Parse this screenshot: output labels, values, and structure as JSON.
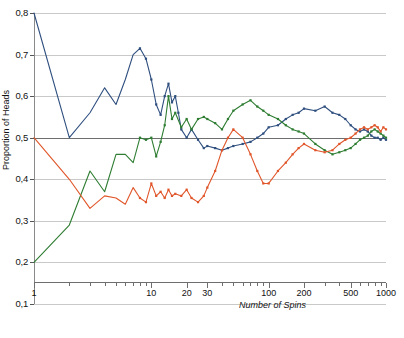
{
  "chart_data": {
    "type": "line",
    "title": "",
    "xlabel": "Number of Spins",
    "ylabel": "Proportion of Heads",
    "xscale": "log",
    "xlim": [
      1,
      1000
    ],
    "ylim": [
      0.1,
      0.8
    ],
    "grid": true,
    "legend": "none",
    "reference_line": {
      "y": 0.5,
      "label": "0,5"
    },
    "y_ticks": [
      0.8,
      0.7,
      0.6,
      0.5,
      0.4,
      0.3,
      0.2,
      0.1
    ],
    "y_tick_labels": [
      "0,8",
      "0,7",
      "0,6",
      "0,5",
      "0,4",
      "0,3",
      "0,2",
      "0,1"
    ],
    "x_ticks": [
      1,
      10,
      20,
      30,
      100,
      200,
      500,
      1000
    ],
    "x_tick_labels": [
      "1",
      "10",
      "20",
      "30",
      "100",
      "200",
      "500",
      "1000"
    ],
    "series": [
      {
        "name": "run-1",
        "color": "#2f4f7f",
        "x": [
          1,
          2,
          3,
          4,
          5,
          6,
          7,
          8,
          9,
          10,
          11,
          12,
          13,
          14,
          15,
          16,
          17,
          18,
          20,
          22,
          25,
          28,
          30,
          35,
          40,
          45,
          50,
          60,
          70,
          80,
          90,
          100,
          120,
          140,
          160,
          180,
          200,
          250,
          300,
          350,
          400,
          450,
          500,
          550,
          600,
          650,
          700,
          750,
          800,
          850,
          900,
          950,
          1000
        ],
        "values": [
          0.8,
          0.5,
          0.56,
          0.62,
          0.58,
          0.64,
          0.7,
          0.715,
          0.69,
          0.64,
          0.58,
          0.555,
          0.6,
          0.63,
          0.585,
          0.6,
          0.56,
          0.52,
          0.5,
          0.52,
          0.495,
          0.475,
          0.48,
          0.475,
          0.47,
          0.475,
          0.48,
          0.485,
          0.49,
          0.5,
          0.51,
          0.525,
          0.53,
          0.545,
          0.555,
          0.56,
          0.57,
          0.565,
          0.575,
          0.56,
          0.555,
          0.545,
          0.53,
          0.52,
          0.515,
          0.52,
          0.515,
          0.505,
          0.5,
          0.5,
          0.495,
          0.5,
          0.495
        ]
      },
      {
        "name": "run-2",
        "color": "#2e7d32",
        "x": [
          1,
          2,
          3,
          4,
          5,
          6,
          7,
          8,
          9,
          10,
          11,
          12,
          13,
          14,
          15,
          16,
          18,
          20,
          22,
          25,
          28,
          30,
          35,
          40,
          45,
          50,
          60,
          70,
          80,
          90,
          100,
          120,
          140,
          160,
          180,
          200,
          250,
          300,
          350,
          400,
          450,
          500,
          550,
          600,
          650,
          700,
          750,
          800,
          850,
          900,
          950,
          1000
        ],
        "values": [
          0.2,
          0.29,
          0.42,
          0.37,
          0.46,
          0.46,
          0.44,
          0.5,
          0.495,
          0.5,
          0.455,
          0.49,
          0.53,
          0.6,
          0.545,
          0.56,
          0.525,
          0.545,
          0.52,
          0.545,
          0.55,
          0.545,
          0.535,
          0.52,
          0.545,
          0.565,
          0.58,
          0.59,
          0.575,
          0.565,
          0.555,
          0.545,
          0.53,
          0.52,
          0.515,
          0.51,
          0.485,
          0.47,
          0.46,
          0.465,
          0.47,
          0.475,
          0.485,
          0.495,
          0.5,
          0.505,
          0.515,
          0.52,
          0.515,
          0.51,
          0.505,
          0.5
        ]
      },
      {
        "name": "run-3",
        "color": "#e0562a",
        "x": [
          1,
          2,
          3,
          4,
          5,
          6,
          7,
          8,
          9,
          10,
          11,
          12,
          13,
          14,
          15,
          16,
          18,
          20,
          22,
          25,
          28,
          30,
          35,
          40,
          45,
          50,
          60,
          70,
          80,
          90,
          100,
          120,
          140,
          160,
          180,
          200,
          250,
          300,
          350,
          400,
          450,
          500,
          550,
          600,
          650,
          700,
          750,
          800,
          850,
          900,
          950,
          1000
        ],
        "values": [
          0.5,
          0.4,
          0.33,
          0.36,
          0.355,
          0.34,
          0.38,
          0.355,
          0.345,
          0.39,
          0.36,
          0.37,
          0.355,
          0.375,
          0.36,
          0.365,
          0.36,
          0.375,
          0.355,
          0.345,
          0.36,
          0.38,
          0.42,
          0.47,
          0.5,
          0.52,
          0.5,
          0.46,
          0.42,
          0.39,
          0.39,
          0.42,
          0.44,
          0.46,
          0.475,
          0.485,
          0.47,
          0.465,
          0.47,
          0.485,
          0.495,
          0.5,
          0.51,
          0.52,
          0.525,
          0.52,
          0.525,
          0.53,
          0.525,
          0.515,
          0.525,
          0.52
        ]
      }
    ]
  }
}
